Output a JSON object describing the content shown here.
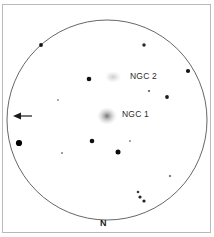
{
  "figure": {
    "kind": "telescope-eyepiece-sketch",
    "background_color": "#ffffff",
    "frame_color": "#b9b9b9",
    "field_circle": {
      "center_x": 107,
      "center_y": 120,
      "radius": 100,
      "stroke_color": "#555555",
      "stroke_width": 0.9
    }
  },
  "labels": {
    "ngc2": "NGC 2",
    "ngc1": "NGC 1",
    "north": "N"
  },
  "direction_arrow": {
    "name": "west-direction-arrow",
    "points": "left",
    "tail_x": 32,
    "tip_x": 13,
    "y": 116,
    "color": "#1a1a1a"
  },
  "chart_data": {
    "type": "scatter",
    "title": "",
    "xlabel": "",
    "ylabel": "",
    "xlim": [
      0,
      214
    ],
    "ylim": [
      0,
      237
    ],
    "grid": false,
    "legend": null,
    "annotations": [
      {
        "text": "NGC 2",
        "x": 130,
        "y": 75
      },
      {
        "text": "NGC 1",
        "x": 122,
        "y": 113
      },
      {
        "text": "N",
        "x": 104,
        "y": 222
      }
    ],
    "nebulae": [
      {
        "name": "NGC 2",
        "x": 113,
        "y": 77,
        "rx": 7.0,
        "ry": 5.0,
        "peak_opacity": 0.34,
        "color": "#6f6f6f"
      },
      {
        "name": "NGC 1",
        "x": 107,
        "y": 116,
        "rx": 8.5,
        "ry": 7.5,
        "peak_opacity": 0.62,
        "color": "#4a4a4a"
      }
    ],
    "stars": [
      {
        "x": 41,
        "y": 45,
        "r": 1.9,
        "color": "#141414"
      },
      {
        "x": 144,
        "y": 45,
        "r": 1.7,
        "color": "#242424"
      },
      {
        "x": 188,
        "y": 71,
        "r": 2.1,
        "color": "#141414"
      },
      {
        "x": 89,
        "y": 79,
        "r": 2.3,
        "color": "#101010"
      },
      {
        "x": 149,
        "y": 91,
        "r": 1.1,
        "color": "#555555"
      },
      {
        "x": 167,
        "y": 97,
        "r": 1.9,
        "color": "#1c1c1c"
      },
      {
        "x": 58,
        "y": 100,
        "r": 0.9,
        "color": "#8a8a8a"
      },
      {
        "x": 19,
        "y": 143,
        "r": 3.1,
        "color": "#000000"
      },
      {
        "x": 92,
        "y": 141,
        "r": 2.3,
        "color": "#101010"
      },
      {
        "x": 130,
        "y": 141,
        "r": 0.9,
        "color": "#7c7c7c"
      },
      {
        "x": 118,
        "y": 152,
        "r": 2.5,
        "color": "#0c0c0c"
      },
      {
        "x": 62,
        "y": 153,
        "r": 1.0,
        "color": "#808080"
      },
      {
        "x": 170,
        "y": 176,
        "r": 1.1,
        "color": "#5e5e5e"
      },
      {
        "x": 138,
        "y": 192,
        "r": 1.3,
        "color": "#3a3a3a"
      },
      {
        "x": 140,
        "y": 197,
        "r": 1.6,
        "color": "#222222"
      },
      {
        "x": 144,
        "y": 201,
        "r": 1.6,
        "color": "#202020"
      }
    ]
  }
}
